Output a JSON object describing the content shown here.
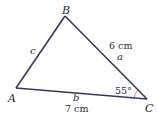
{
  "diagram": {
    "type": "triangle",
    "vertices": {
      "A": {
        "label": "A",
        "x": 16,
        "y": 88
      },
      "B": {
        "label": "B",
        "x": 65,
        "y": 16
      },
      "C": {
        "label": "C",
        "x": 147,
        "y": 99
      }
    },
    "sides": {
      "a": {
        "label": "a",
        "measure": "6 cm",
        "between": [
          "B",
          "C"
        ]
      },
      "b": {
        "label": "b",
        "measure": "7 cm",
        "between": [
          "A",
          "C"
        ]
      },
      "c": {
        "label": "c",
        "measure": "",
        "between": [
          "A",
          "B"
        ]
      }
    },
    "angle_C": {
      "label": "55°",
      "vertex": "C"
    },
    "colors": {
      "edge": "#3a3560",
      "angle_arc": "#e08a3c",
      "text": "#2a2a3a"
    }
  }
}
